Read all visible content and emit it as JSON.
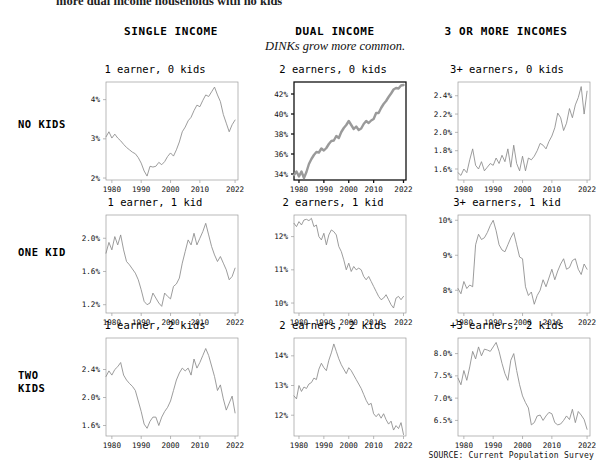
{
  "page": {
    "clipped_top_text": "more dual income households with no kids",
    "source_note": "SOURCE: Current Population Survey"
  },
  "columns": [
    {
      "label": "SINGLE INCOME",
      "subtitle": ""
    },
    {
      "label": "DUAL INCOME",
      "subtitle": "DINKs grow more common."
    },
    {
      "label": "3 OR MORE INCOMES",
      "subtitle": ""
    }
  ],
  "rows": [
    {
      "label": "NO KIDS"
    },
    {
      "label": "ONE KID"
    },
    {
      "label": "TWO\nKIDS"
    }
  ],
  "colors": {
    "line": "#8a8a8a",
    "line_highlight": "#9a9a9a",
    "axis": "#9b9b9b",
    "axis_highlight": "#111111",
    "text": "#111111"
  },
  "chart_data": [
    {
      "type": "line",
      "title": "1 earner, 0 kids",
      "row": "NO KIDS",
      "column": "SINGLE INCOME",
      "highlight": false,
      "xlabel": "",
      "ylabel": "",
      "xticks": [
        1980,
        1990,
        2000,
        2010,
        2022
      ],
      "ytick_labels": [
        "2%",
        "3%",
        "4%"
      ],
      "yticks": [
        2,
        3,
        4
      ],
      "xlim": [
        1978,
        2023
      ],
      "ylim": [
        1.95,
        4.45
      ],
      "x": [
        1978,
        1979,
        1980,
        1981,
        1982,
        1983,
        1984,
        1985,
        1986,
        1987,
        1988,
        1989,
        1990,
        1991,
        1992,
        1993,
        1994,
        1995,
        1996,
        1997,
        1998,
        1999,
        2000,
        2001,
        2002,
        2003,
        2004,
        2005,
        2006,
        2007,
        2008,
        2009,
        2010,
        2011,
        2012,
        2013,
        2014,
        2015,
        2016,
        2017,
        2018,
        2019,
        2020,
        2021,
        2022
      ],
      "values": [
        3.05,
        3.18,
        3.02,
        3.12,
        3.02,
        2.95,
        2.86,
        2.78,
        2.72,
        2.66,
        2.62,
        2.52,
        2.38,
        2.18,
        2.05,
        2.3,
        2.28,
        2.3,
        2.4,
        2.34,
        2.42,
        2.55,
        2.64,
        2.56,
        2.72,
        2.92,
        3.18,
        3.3,
        3.46,
        3.55,
        3.72,
        3.86,
        3.82,
        3.98,
        4.12,
        4.08,
        4.2,
        4.32,
        4.12,
        3.95,
        3.62,
        3.4,
        3.18,
        3.36,
        3.48
      ]
    },
    {
      "type": "line",
      "title": "2 earners, 0 kids",
      "row": "NO KIDS",
      "column": "DUAL INCOME",
      "highlight": true,
      "xlabel": "",
      "ylabel": "",
      "xticks": [
        1980,
        1990,
        2000,
        2010,
        2022
      ],
      "ytick_labels": [
        "34%",
        "36%",
        "38%",
        "40%",
        "42%"
      ],
      "yticks": [
        34,
        36,
        38,
        40,
        42
      ],
      "xlim": [
        1978,
        2023
      ],
      "ylim": [
        33.4,
        43.2
      ],
      "x": [
        1978,
        1979,
        1980,
        1981,
        1982,
        1983,
        1984,
        1985,
        1986,
        1987,
        1988,
        1989,
        1990,
        1991,
        1992,
        1993,
        1994,
        1995,
        1996,
        1997,
        1998,
        1999,
        2000,
        2001,
        2002,
        2003,
        2004,
        2005,
        2006,
        2007,
        2008,
        2009,
        2010,
        2011,
        2012,
        2013,
        2014,
        2015,
        2016,
        2017,
        2018,
        2019,
        2020,
        2021,
        2022
      ],
      "values": [
        33.9,
        34.25,
        33.75,
        34.25,
        33.6,
        34.2,
        35.0,
        35.5,
        35.9,
        36.2,
        36.15,
        36.55,
        36.35,
        36.6,
        37.0,
        37.3,
        37.35,
        37.8,
        37.6,
        38.2,
        38.6,
        38.9,
        39.3,
        38.9,
        38.5,
        38.75,
        38.4,
        38.55,
        39.0,
        39.3,
        39.1,
        39.35,
        39.5,
        40.1,
        40.1,
        40.6,
        41.0,
        41.3,
        41.7,
        42.05,
        42.45,
        42.6,
        42.55,
        42.85,
        42.9
      ]
    },
    {
      "type": "line",
      "title": "3+ earners, 0 kids",
      "row": "NO KIDS",
      "column": "3 OR MORE INCOMES",
      "highlight": false,
      "xlabel": "",
      "ylabel": "",
      "xticks": [
        1980,
        1990,
        2000,
        2010,
        2022
      ],
      "ytick_labels": [
        "1.6%",
        "1.8%",
        "2.0%",
        "2.2%",
        "2.4%"
      ],
      "yticks": [
        1.6,
        1.8,
        2.0,
        2.2,
        2.4
      ],
      "xlim": [
        1978,
        2023
      ],
      "ylim": [
        1.48,
        2.55
      ],
      "x": [
        1978,
        1979,
        1980,
        1981,
        1982,
        1983,
        1984,
        1985,
        1986,
        1987,
        1988,
        1989,
        1990,
        1991,
        1992,
        1993,
        1994,
        1995,
        1996,
        1997,
        1998,
        1999,
        2000,
        2001,
        2002,
        2003,
        2004,
        2005,
        2006,
        2007,
        2008,
        2009,
        2010,
        2011,
        2012,
        2013,
        2014,
        2015,
        2016,
        2017,
        2018,
        2019,
        2020,
        2021,
        2022
      ],
      "values": [
        1.56,
        1.53,
        1.6,
        1.56,
        1.7,
        1.82,
        1.64,
        1.6,
        1.68,
        1.58,
        1.62,
        1.66,
        1.64,
        1.72,
        1.66,
        1.75,
        1.68,
        1.82,
        1.62,
        1.86,
        1.66,
        1.58,
        1.74,
        1.58,
        1.72,
        1.7,
        1.74,
        1.8,
        1.88,
        1.86,
        1.82,
        1.9,
        1.96,
        2.05,
        2.21,
        2.16,
        2.02,
        2.1,
        2.26,
        2.16,
        2.3,
        2.38,
        2.5,
        2.2,
        2.45
      ]
    },
    {
      "type": "line",
      "title": "1 earner, 1 kid",
      "row": "ONE KID",
      "column": "SINGLE INCOME",
      "highlight": false,
      "xlabel": "",
      "ylabel": "",
      "xticks": [
        1980,
        1990,
        2000,
        2010,
        2022
      ],
      "ytick_labels": [
        "1.2%",
        "1.6%",
        "2.0%"
      ],
      "yticks": [
        1.2,
        1.6,
        2.0
      ],
      "xlim": [
        1978,
        2023
      ],
      "ylim": [
        1.1,
        2.28
      ],
      "x": [
        1978,
        1979,
        1980,
        1981,
        1982,
        1983,
        1984,
        1985,
        1986,
        1987,
        1988,
        1989,
        1990,
        1991,
        1992,
        1993,
        1994,
        1995,
        1996,
        1997,
        1998,
        1999,
        2000,
        2001,
        2002,
        2003,
        2004,
        2005,
        2006,
        2007,
        2008,
        2009,
        2010,
        2011,
        2012,
        2013,
        2014,
        2015,
        2016,
        2017,
        2018,
        2019,
        2020,
        2021,
        2022
      ],
      "values": [
        1.82,
        1.95,
        1.86,
        2.02,
        1.92,
        2.04,
        1.86,
        1.72,
        1.68,
        1.63,
        1.58,
        1.5,
        1.38,
        1.24,
        1.2,
        1.22,
        1.34,
        1.28,
        1.22,
        1.18,
        1.34,
        1.3,
        1.27,
        1.42,
        1.45,
        1.52,
        1.7,
        1.84,
        1.98,
        1.92,
        2.06,
        1.92,
        2.0,
        2.08,
        2.18,
        2.04,
        1.9,
        1.8,
        1.72,
        1.78,
        1.7,
        1.62,
        1.5,
        1.54,
        1.64
      ]
    },
    {
      "type": "line",
      "title": "2 earners, 1 kid",
      "row": "ONE KID",
      "column": "DUAL INCOME",
      "highlight": false,
      "xlabel": "",
      "ylabel": "",
      "xticks": [
        1980,
        1990,
        2000,
        2010,
        2022
      ],
      "ytick_labels": [
        "10%",
        "11%",
        "12%"
      ],
      "yticks": [
        10,
        11,
        12
      ],
      "xlim": [
        1978,
        2023
      ],
      "ylim": [
        9.7,
        12.65
      ],
      "x": [
        1978,
        1979,
        1980,
        1981,
        1982,
        1983,
        1984,
        1985,
        1986,
        1987,
        1988,
        1989,
        1990,
        1991,
        1992,
        1993,
        1994,
        1995,
        1996,
        1997,
        1998,
        1999,
        2000,
        2001,
        2002,
        2003,
        2004,
        2005,
        2006,
        2007,
        2008,
        2009,
        2010,
        2011,
        2012,
        2013,
        2014,
        2015,
        2016,
        2017,
        2018,
        2019,
        2020,
        2021,
        2022
      ],
      "values": [
        12.4,
        12.3,
        12.45,
        12.35,
        12.5,
        12.52,
        12.48,
        12.55,
        12.3,
        12.35,
        12.0,
        11.9,
        12.1,
        11.75,
        12.05,
        12.2,
        12.15,
        12.05,
        11.7,
        11.55,
        11.3,
        11.0,
        11.2,
        10.95,
        11.1,
        11.0,
        11.05,
        11.0,
        10.8,
        10.7,
        10.8,
        10.65,
        10.5,
        10.35,
        10.2,
        10.1,
        10.15,
        10.25,
        10.1,
        9.95,
        9.85,
        10.15,
        10.2,
        10.1,
        10.2
      ]
    },
    {
      "type": "line",
      "title": "3+ earners, 1 kid",
      "row": "ONE KID",
      "column": "3 OR MORE INCOMES",
      "highlight": false,
      "xlabel": "",
      "ylabel": "",
      "xticks": [
        1980,
        1990,
        2000,
        2010,
        2022
      ],
      "ytick_labels": [
        "8%",
        "9%",
        "10%"
      ],
      "yticks": [
        8,
        9,
        10
      ],
      "xlim": [
        1978,
        2023
      ],
      "ylim": [
        7.35,
        10.15
      ],
      "x": [
        1978,
        1979,
        1980,
        1981,
        1982,
        1983,
        1984,
        1985,
        1986,
        1987,
        1988,
        1989,
        1990,
        1991,
        1992,
        1993,
        1994,
        1995,
        1996,
        1997,
        1998,
        1999,
        2000,
        2001,
        2002,
        2003,
        2004,
        2005,
        2006,
        2007,
        2008,
        2009,
        2010,
        2011,
        2012,
        2013,
        2014,
        2015,
        2016,
        2017,
        2018,
        2019,
        2020,
        2021,
        2022
      ],
      "values": [
        8.05,
        7.9,
        8.25,
        8.05,
        8.15,
        8.1,
        9.3,
        9.6,
        9.45,
        9.5,
        9.65,
        9.85,
        10.0,
        9.7,
        9.3,
        9.15,
        9.1,
        9.3,
        9.5,
        9.65,
        9.3,
        8.95,
        8.9,
        8.1,
        7.85,
        7.95,
        7.6,
        7.85,
        8.0,
        8.3,
        8.1,
        8.35,
        8.6,
        8.3,
        8.55,
        8.75,
        8.9,
        8.6,
        8.65,
        8.85,
        8.9,
        8.6,
        8.45,
        8.75,
        8.6
      ]
    },
    {
      "type": "line",
      "title": "1 earner, 2 kids",
      "row": "TWO KIDS",
      "column": "SINGLE INCOME",
      "highlight": false,
      "xlabel": "",
      "ylabel": "",
      "xticks": [
        1980,
        1990,
        2000,
        2010,
        2022
      ],
      "ytick_labels": [
        "1.6%",
        "2.0%",
        "2.4%"
      ],
      "yticks": [
        1.6,
        2.0,
        2.4
      ],
      "xlim": [
        1978,
        2023
      ],
      "ylim": [
        1.45,
        2.85
      ],
      "x": [
        1978,
        1979,
        1980,
        1981,
        1982,
        1983,
        1984,
        1985,
        1986,
        1987,
        1988,
        1989,
        1990,
        1991,
        1992,
        1993,
        1994,
        1995,
        1996,
        1997,
        1998,
        1999,
        2000,
        2001,
        2002,
        2003,
        2004,
        2005,
        2006,
        2007,
        2008,
        2009,
        2010,
        2011,
        2012,
        2013,
        2014,
        2015,
        2016,
        2017,
        2018,
        2019,
        2020,
        2021,
        2022
      ],
      "values": [
        2.3,
        2.38,
        2.32,
        2.4,
        2.44,
        2.5,
        2.32,
        2.25,
        2.2,
        2.16,
        2.1,
        1.95,
        1.8,
        1.62,
        1.56,
        1.66,
        1.72,
        1.72,
        1.6,
        1.72,
        1.8,
        1.86,
        1.95,
        2.1,
        2.25,
        2.35,
        2.42,
        2.38,
        2.42,
        2.32,
        2.55,
        2.42,
        2.5,
        2.6,
        2.7,
        2.6,
        2.45,
        2.3,
        2.1,
        2.18,
        1.98,
        1.82,
        1.92,
        2.02,
        1.78
      ]
    },
    {
      "type": "line",
      "title": "2 earners, 2 kids",
      "row": "TWO KIDS",
      "column": "DUAL INCOME",
      "highlight": false,
      "xlabel": "",
      "ylabel": "",
      "xticks": [
        1980,
        1990,
        2000,
        2010,
        2022
      ],
      "ytick_labels": [
        "12%",
        "13%",
        "14%"
      ],
      "yticks": [
        12,
        13,
        14
      ],
      "xlim": [
        1978,
        2023
      ],
      "ylim": [
        11.3,
        14.6
      ],
      "x": [
        1978,
        1979,
        1980,
        1981,
        1982,
        1983,
        1984,
        1985,
        1986,
        1987,
        1988,
        1989,
        1990,
        1991,
        1992,
        1993,
        1994,
        1995,
        1996,
        1997,
        1998,
        1999,
        2000,
        2001,
        2002,
        2003,
        2004,
        2005,
        2006,
        2007,
        2008,
        2009,
        2010,
        2011,
        2012,
        2013,
        2014,
        2015,
        2016,
        2017,
        2018,
        2019,
        2020,
        2021,
        2022
      ],
      "values": [
        12.65,
        12.55,
        13.0,
        12.8,
        12.95,
        12.9,
        13.05,
        13.1,
        13.25,
        13.2,
        13.55,
        13.75,
        13.6,
        13.5,
        13.85,
        14.1,
        14.4,
        14.15,
        13.9,
        13.7,
        13.55,
        13.4,
        13.6,
        13.5,
        13.35,
        13.2,
        13.05,
        12.9,
        12.7,
        12.5,
        12.35,
        12.4,
        12.05,
        11.95,
        12.05,
        11.9,
        12.05,
        11.85,
        11.7,
        11.8,
        11.5,
        11.65,
        11.55,
        11.75,
        11.35
      ]
    },
    {
      "type": "line",
      "title": "+3 earners, 2 kids",
      "row": "TWO KIDS",
      "column": "3 OR MORE INCOMES",
      "highlight": false,
      "xlabel": "",
      "ylabel": "",
      "xticks": [
        1980,
        1990,
        2000,
        2010,
        2022
      ],
      "ytick_labels": [
        "6.5%",
        "7.0%",
        "7.5%",
        "8.0%"
      ],
      "yticks": [
        6.5,
        7.0,
        7.5,
        8.0
      ],
      "xlim": [
        1978,
        2023
      ],
      "ylim": [
        6.15,
        8.35
      ],
      "x": [
        1978,
        1979,
        1980,
        1981,
        1982,
        1983,
        1984,
        1985,
        1986,
        1987,
        1988,
        1989,
        1990,
        1991,
        1992,
        1993,
        1994,
        1995,
        1996,
        1997,
        1998,
        1999,
        2000,
        2001,
        2002,
        2003,
        2004,
        2005,
        2006,
        2007,
        2008,
        2009,
        2010,
        2011,
        2012,
        2013,
        2014,
        2015,
        2016,
        2017,
        2018,
        2019,
        2020,
        2021,
        2022
      ],
      "values": [
        7.45,
        7.3,
        7.62,
        7.4,
        7.7,
        8.05,
        7.88,
        8.15,
        7.95,
        8.1,
        8.08,
        8.05,
        8.15,
        8.25,
        8.05,
        7.78,
        7.55,
        7.4,
        7.85,
        8.0,
        7.62,
        7.3,
        7.05,
        6.9,
        6.78,
        6.4,
        6.45,
        6.6,
        6.62,
        6.5,
        6.6,
        6.68,
        6.65,
        6.45,
        6.4,
        6.42,
        6.5,
        6.6,
        6.52,
        6.75,
        6.45,
        6.7,
        6.62,
        6.52,
        6.3
      ]
    }
  ]
}
